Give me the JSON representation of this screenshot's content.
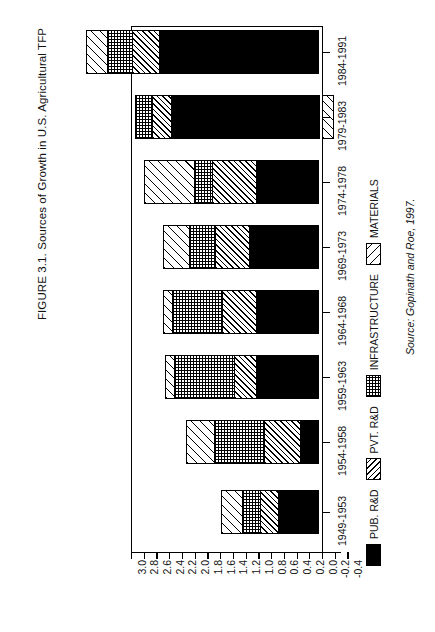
{
  "figure": {
    "title": "FIGURE 3.1. Sources of Growth in U.S. Agricultural TFP",
    "source": "Source: Gopinath and Roe, 1997."
  },
  "legend": {
    "items": [
      {
        "label": "PUB. R&D",
        "pattern": "solid-black",
        "color": "#000000"
      },
      {
        "label": "PVT. R&D",
        "pattern": "diagonal-fine",
        "color": "#000000"
      },
      {
        "label": "INFRASTRUCTURE",
        "pattern": "checkerboard",
        "color": "#000000"
      },
      {
        "label": "MATERIALS",
        "pattern": "diagonal-wide",
        "color": "#000000"
      }
    ]
  },
  "axis": {
    "tick_labels": [
      "3.0",
      "2.8",
      "2.6",
      "2.4",
      "2.2",
      "2.0",
      "1.8",
      "1.6",
      "1.4",
      "1.2",
      "1.0",
      "0.8",
      "0.6",
      "0.4",
      "0.2",
      "0.0",
      "-0.2",
      "-0.4"
    ],
    "min": -0.4,
    "max": 3.0,
    "reversed": true
  },
  "chart_data": {
    "type": "bar",
    "orientation": "horizontal-stacked",
    "title": "FIGURE 3.1. Sources of Growth in U.S. Agricultural TFP",
    "xlabel": "",
    "ylabel": "",
    "xlim": [
      -0.4,
      3.0
    ],
    "grid": false,
    "legend_position": "bottom",
    "categories": [
      "1949-1953",
      "1954-1958",
      "1959-1963",
      "1964-1968",
      "1969-1973",
      "1974-1978",
      "1979-1983",
      "1984-1991"
    ],
    "series": [
      {
        "name": "PUB. R&D",
        "values": [
          0.64,
          0.3,
          1.0,
          1.0,
          1.1,
          1.0,
          2.35,
          1.9
        ]
      },
      {
        "name": "PVT. R&D",
        "values": [
          0.3,
          0.58,
          0.36,
          0.45,
          0.55,
          0.7,
          0.3,
          0.55
        ]
      },
      {
        "name": "INFRASTRUCTURE",
        "values": [
          0.3,
          0.8,
          0.95,
          0.8,
          0.42,
          0.3,
          0.3,
          0.52
        ]
      },
      {
        "name": "MATERIALS",
        "values": [
          0.34,
          0.32,
          0.15,
          0.15,
          0.42,
          0.8,
          -0.18,
          0.44
        ]
      }
    ],
    "totals": [
      1.58,
      2.0,
      2.46,
      2.4,
      2.49,
      2.8,
      2.77,
      3.41
    ]
  },
  "bars": [
    {
      "period": "1984-1991",
      "y": 30,
      "segments": [
        {
          "series": "MATERIALS",
          "class": "mat",
          "w": 22
        },
        {
          "series": "INFRASTRUCTURE",
          "class": "inf",
          "w": 26
        },
        {
          "series": "PVT. R&D",
          "class": "pvt",
          "w": 28
        },
        {
          "series": "PUB. R&D",
          "class": "pub",
          "w": 160
        }
      ]
    },
    {
      "period": "1979-1983",
      "y": 95,
      "segments": [
        {
          "series": "INFRASTRUCTURE",
          "class": "inf",
          "w": 18
        },
        {
          "series": "PVT. R&D",
          "class": "pvt",
          "w": 20
        },
        {
          "series": "PUB. R&D",
          "class": "pub",
          "w": 149
        }
      ],
      "negative": {
        "series": "MATERIALS",
        "class": "mat",
        "w": 12
      }
    },
    {
      "period": "1974-1978",
      "y": 160,
      "segments": [
        {
          "series": "MATERIALS",
          "class": "mat",
          "w": 51
        },
        {
          "series": "INFRASTRUCTURE",
          "class": "inf",
          "w": 19
        },
        {
          "series": "PVT. R&D",
          "class": "pvt",
          "w": 45
        },
        {
          "series": "PUB. R&D",
          "class": "pub",
          "w": 63
        }
      ]
    },
    {
      "period": "1969-1973",
      "y": 225,
      "segments": [
        {
          "series": "MATERIALS",
          "class": "mat",
          "w": 27
        },
        {
          "series": "INFRASTRUCTURE",
          "class": "inf",
          "w": 27
        },
        {
          "series": "PVT. R&D",
          "class": "pvt",
          "w": 35
        },
        {
          "series": "PUB. R&D",
          "class": "pub",
          "w": 70
        }
      ]
    },
    {
      "period": "1964-1968",
      "y": 290,
      "segments": [
        {
          "series": "MATERIALS",
          "class": "mat",
          "w": 10
        },
        {
          "series": "INFRASTRUCTURE",
          "class": "inf",
          "w": 51
        },
        {
          "series": "PVT. R&D",
          "class": "pvt",
          "w": 35
        },
        {
          "series": "PUB. R&D",
          "class": "pub",
          "w": 63
        }
      ]
    },
    {
      "period": "1959-1963",
      "y": 355,
      "segments": [
        {
          "series": "MATERIALS",
          "class": "mat",
          "w": 10
        },
        {
          "series": "INFRASTRUCTURE",
          "class": "inf",
          "w": 61
        },
        {
          "series": "PVT. R&D",
          "class": "pvt",
          "w": 23
        },
        {
          "series": "PUB. R&D",
          "class": "pub",
          "w": 63
        }
      ]
    },
    {
      "period": "1954-1958",
      "y": 420,
      "segments": [
        {
          "series": "MATERIALS",
          "class": "mat",
          "w": 29
        },
        {
          "series": "INFRASTRUCTURE",
          "class": "inf",
          "w": 51
        },
        {
          "series": "PVT. R&D",
          "class": "pvt",
          "w": 37
        },
        {
          "series": "PUB. R&D",
          "class": "pub",
          "w": 19
        }
      ]
    },
    {
      "period": "1949-1953",
      "y": 490,
      "segments": [
        {
          "series": "MATERIALS",
          "class": "mat",
          "w": 22
        },
        {
          "series": "INFRASTRUCTURE",
          "class": "inf",
          "w": 19
        },
        {
          "series": "PVT. R&D",
          "class": "pvt",
          "w": 19
        },
        {
          "series": "PUB. R&D",
          "class": "pub",
          "w": 41
        }
      ]
    }
  ]
}
